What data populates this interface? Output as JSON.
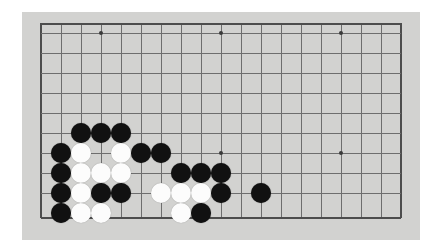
{
  "app": {
    "title": "Go Board Position",
    "board_label": "go-board"
  },
  "board": {
    "size": 19,
    "colors": {
      "surface": "#d2d2d0",
      "grid_line": "#6e6e6e",
      "edge_line": "#4d4d4d",
      "black_stone": "#111111",
      "white_stone": "#fcfcfc",
      "page_background": "#ffffff"
    },
    "geometry": {
      "origin_x": 19,
      "origin_y": 21,
      "spacing": 20,
      "visible_columns": 19,
      "visible_rows": 10,
      "stone_diameter": 20
    },
    "star_points": [
      {
        "col": 3,
        "row": 0
      },
      {
        "col": 9,
        "row": 0
      },
      {
        "col": 15,
        "row": 0
      },
      {
        "col": 9,
        "row": 6
      },
      {
        "col": 15,
        "row": 6
      }
    ],
    "stones": [
      {
        "col": 2,
        "row": 5,
        "color": "black"
      },
      {
        "col": 3,
        "row": 5,
        "color": "black"
      },
      {
        "col": 4,
        "row": 5,
        "color": "black"
      },
      {
        "col": 1,
        "row": 6,
        "color": "black"
      },
      {
        "col": 2,
        "row": 6,
        "color": "white"
      },
      {
        "col": 4,
        "row": 6,
        "color": "white"
      },
      {
        "col": 5,
        "row": 6,
        "color": "black"
      },
      {
        "col": 6,
        "row": 6,
        "color": "black"
      },
      {
        "col": 1,
        "row": 7,
        "color": "black"
      },
      {
        "col": 2,
        "row": 7,
        "color": "white"
      },
      {
        "col": 3,
        "row": 7,
        "color": "white"
      },
      {
        "col": 4,
        "row": 7,
        "color": "white"
      },
      {
        "col": 7,
        "row": 7,
        "color": "black"
      },
      {
        "col": 8,
        "row": 7,
        "color": "black"
      },
      {
        "col": 9,
        "row": 7,
        "color": "black"
      },
      {
        "col": 1,
        "row": 8,
        "color": "black"
      },
      {
        "col": 2,
        "row": 8,
        "color": "white"
      },
      {
        "col": 3,
        "row": 8,
        "color": "black"
      },
      {
        "col": 4,
        "row": 8,
        "color": "black"
      },
      {
        "col": 6,
        "row": 8,
        "color": "white"
      },
      {
        "col": 7,
        "row": 8,
        "color": "white"
      },
      {
        "col": 8,
        "row": 8,
        "color": "white"
      },
      {
        "col": 9,
        "row": 8,
        "color": "black"
      },
      {
        "col": 11,
        "row": 8,
        "color": "black"
      },
      {
        "col": 1,
        "row": 9,
        "color": "black"
      },
      {
        "col": 2,
        "row": 9,
        "color": "white"
      },
      {
        "col": 3,
        "row": 9,
        "color": "white"
      },
      {
        "col": 7,
        "row": 9,
        "color": "white"
      },
      {
        "col": 8,
        "row": 9,
        "color": "black"
      }
    ],
    "counts": {
      "black_stones": 18,
      "white_stones": 11,
      "total_stones": 29
    }
  }
}
